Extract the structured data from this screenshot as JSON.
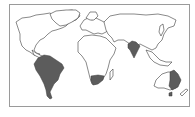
{
  "map": {
    "type": "world-outline",
    "projection": "simplified equirectangular",
    "colors": {
      "background": "#ffffff",
      "land": "#ffffff",
      "outline": "#3a3a3a",
      "highlight": "#5c5c5c",
      "frame": "#9a9a9a"
    },
    "highlighted_regions": [
      {
        "name": "South America"
      },
      {
        "name": "Southern Africa"
      },
      {
        "name": "India"
      },
      {
        "name": "Eastern Australia"
      }
    ]
  }
}
